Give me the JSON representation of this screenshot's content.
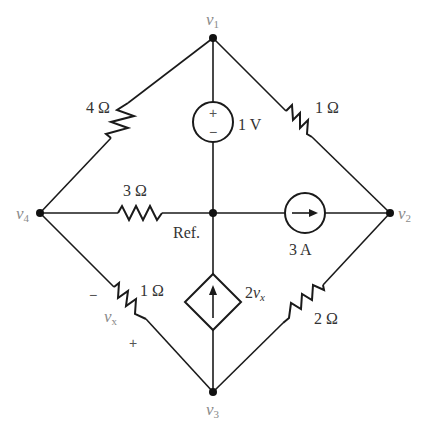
{
  "diagram": {
    "type": "circuit-schematic",
    "nodes": {
      "v1": {
        "label": "v",
        "sub": "1"
      },
      "v2": {
        "label": "v",
        "sub": "2"
      },
      "v3": {
        "label": "v",
        "sub": "3"
      },
      "v4": {
        "label": "v",
        "sub": "4"
      },
      "ref": {
        "label": "Ref."
      }
    },
    "components": {
      "r_v1_v4": {
        "value": "4 Ω",
        "between": [
          "v1",
          "v4"
        ]
      },
      "r_v1_v2": {
        "value": "1 Ω",
        "between": [
          "v1",
          "v2"
        ]
      },
      "r_v4_ref": {
        "value": "3 Ω",
        "between": [
          "v4",
          "ref"
        ]
      },
      "r_v4_v3": {
        "value": "1 Ω",
        "between": [
          "v4",
          "v3"
        ],
        "voltage_label": "v",
        "voltage_sub": "x",
        "minus": "−",
        "plus": "+"
      },
      "r_v2_v3": {
        "value": "2 Ω",
        "between": [
          "v2",
          "v3"
        ]
      },
      "vsrc": {
        "value": "1 V",
        "between": [
          "v1",
          "ref"
        ],
        "plus": "+",
        "minus": "−"
      },
      "isrc": {
        "value": "3 A",
        "between": [
          "ref",
          "v2"
        ],
        "direction": "toward v2"
      },
      "dep_isrc": {
        "coef": "2",
        "var": "v",
        "var_sub": "x",
        "between": [
          "v3",
          "ref"
        ],
        "direction": "toward ref"
      }
    }
  }
}
